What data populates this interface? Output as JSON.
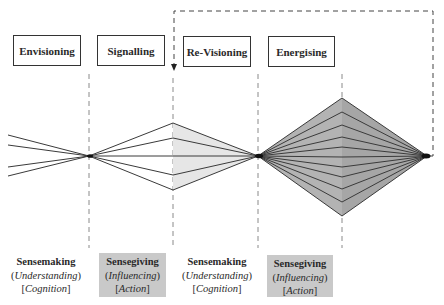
{
  "stages": [
    {
      "label": "Envisioning"
    },
    {
      "label": "Signalling"
    },
    {
      "label": "Re-Visioning"
    },
    {
      "label": "Energising"
    }
  ],
  "processes": [
    {
      "title": "Sensemaking",
      "paren_open": "(",
      "paren_word": "Understanding",
      "paren_close": ")",
      "bracket_open": "[",
      "bracket_word": "Cognition",
      "bracket_close": "]",
      "shaded": false
    },
    {
      "title": "Sensegiving",
      "paren_open": "(",
      "paren_word": "Influencing",
      "paren_close": ")",
      "bracket_open": "[",
      "bracket_word": "Action",
      "bracket_close": "]",
      "shaded": true
    },
    {
      "title": "Sensemaking",
      "paren_open": "(",
      "paren_word": "Understanding",
      "paren_close": ")",
      "bracket_open": "[",
      "bracket_word": "Cognition",
      "bracket_close": "]",
      "shaded": false
    },
    {
      "title": "Sensegiving",
      "paren_open": "(",
      "paren_word": "Influencing",
      "paren_close": ")",
      "bracket_open": "[",
      "bracket_word": "Action",
      "bracket_close": "]",
      "shaded": true
    }
  ],
  "colors": {
    "line": "#3a3a3a",
    "dashed": "#8a8a8a",
    "light_fill": "#e4e4e4",
    "dark_fill": "#a9a9a9",
    "dark_fill_right": "#b8b8b8",
    "label_shade": "#c9c9c9"
  }
}
